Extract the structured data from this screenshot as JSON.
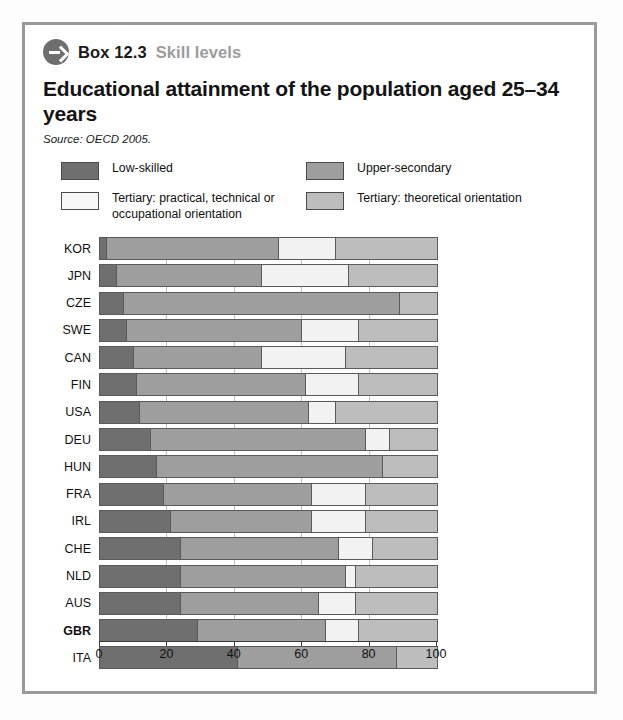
{
  "box": {
    "icon": "arrow-right-circle-icon",
    "number": "Box 12.3",
    "subtitle": "Skill levels",
    "title": "Educational attainment of the population aged 25–34 years",
    "source": "Source: OECD 2005."
  },
  "legend": [
    {
      "label": "Low-skilled",
      "color": "#6f6f6f",
      "key": "low"
    },
    {
      "label": "Upper-secondary",
      "color": "#9e9e9e",
      "key": "upper"
    },
    {
      "label": "Tertiary: practical, technical or occupational orientation",
      "color": "#f2f2f2",
      "key": "practical"
    },
    {
      "label": "Tertiary: theoretical orientation",
      "color": "#bdbdbd",
      "key": "theor"
    }
  ],
  "chart_data": {
    "type": "bar",
    "orientation": "horizontal",
    "stacked": true,
    "title": "Educational attainment of the population aged 25–34 years",
    "xlabel": "",
    "ylabel": "",
    "xlim": [
      0,
      100
    ],
    "xticks": [
      0,
      20,
      40,
      60,
      80,
      100
    ],
    "grid": true,
    "legend_position": "top",
    "categories": [
      "KOR",
      "JPN",
      "CZE",
      "SWE",
      "CAN",
      "FIN",
      "USA",
      "DEU",
      "HUN",
      "FRA",
      "IRL",
      "CHE",
      "NLD",
      "AUS",
      "GBR",
      "ITA"
    ],
    "series": [
      {
        "name": "Low-skilled",
        "color": "#6f6f6f",
        "values": [
          2,
          5,
          7,
          8,
          10,
          11,
          12,
          15,
          17,
          19,
          21,
          24,
          24,
          24,
          29,
          41
        ]
      },
      {
        "name": "Upper-secondary",
        "color": "#9e9e9e",
        "values": [
          51,
          43,
          82,
          52,
          38,
          50,
          50,
          64,
          67,
          44,
          42,
          47,
          49,
          41,
          38,
          47
        ]
      },
      {
        "name": "Tertiary: practical, technical or occupational orientation",
        "color": "#f2f2f2",
        "values": [
          17,
          26,
          0,
          17,
          25,
          16,
          8,
          7,
          0,
          16,
          16,
          10,
          3,
          11,
          10,
          0
        ]
      },
      {
        "name": "Tertiary: theoretical orientation",
        "color": "#bdbdbd",
        "values": [
          30,
          26,
          11,
          23,
          27,
          23,
          30,
          14,
          16,
          21,
          21,
          19,
          24,
          24,
          23,
          12
        ]
      }
    ],
    "bold_category": "GBR"
  }
}
